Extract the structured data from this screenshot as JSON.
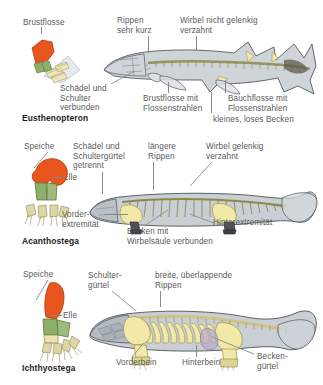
{
  "figure": {
    "type": "scientific-diagram",
    "language": "de"
  },
  "colors": {
    "humerus": "#e8561e",
    "radius_ulna": "#8cb06a",
    "digits": "#e8e2b4",
    "bone_yellow": "#f2e9a8",
    "body_grey": "#c3cad0",
    "body_outline": "#4d4d4d",
    "spine_olive": "#8c8a4a",
    "label_text": "#5a5a5a",
    "species_text": "#1d1d1d",
    "leader_line": "#8a8a8a",
    "background": "#ffffff"
  },
  "panels": [
    {
      "id": "eusthenopteron",
      "species": "Eusthenopteron",
      "limb_label": "Brustflosse",
      "labels": [
        {
          "key": "rippen",
          "text": "Rippen\nsehr kurz"
        },
        {
          "key": "wirbel",
          "text": "Wirbel nicht gelenkig\nverzahnt"
        },
        {
          "key": "schaedel",
          "text": "Schädel und\nSchulter\nverbunden"
        },
        {
          "key": "brustflosse",
          "text": "Brustflosse mit\nFlossenstrahlen"
        },
        {
          "key": "bauchflosse",
          "text": "Bauchflosse mit\nFlossenstrahlen"
        },
        {
          "key": "becken",
          "text": "kleines, loses Becken"
        }
      ]
    },
    {
      "id": "acanthostega",
      "species": "Acanthostega",
      "limb_labels": [
        {
          "key": "speiche",
          "text": "Speiche"
        },
        {
          "key": "elle",
          "text": "Elle"
        }
      ],
      "labels": [
        {
          "key": "schaedel",
          "text": "Schädel und\nSchultergürtel\ngetrennt"
        },
        {
          "key": "rippen",
          "text": "längere\nRippen"
        },
        {
          "key": "wirbel",
          "text": "Wirbel gelenkig\nverzahnt"
        },
        {
          "key": "vorder",
          "text": "Vorder-\nextremität"
        },
        {
          "key": "becken",
          "text": "Becken mit\nWirbelsäule verbunden"
        },
        {
          "key": "hinter",
          "text": "Hinterextremität"
        }
      ]
    },
    {
      "id": "ichthyostega",
      "species": "Ichthyostega",
      "limb_labels": [
        {
          "key": "speiche",
          "text": "Speiche"
        },
        {
          "key": "elle",
          "text": "Elle"
        }
      ],
      "labels": [
        {
          "key": "schulter",
          "text": "Schulter-\ngürtel"
        },
        {
          "key": "rippen",
          "text": "breite, überlappende\nRippen"
        },
        {
          "key": "vorderbein",
          "text": "Vorderbein"
        },
        {
          "key": "hinterbein",
          "text": "Hinterbein"
        },
        {
          "key": "becken",
          "text": "Becken-\ngürtel"
        }
      ]
    }
  ]
}
